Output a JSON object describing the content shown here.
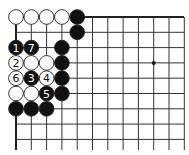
{
  "diagram": {
    "type": "go-board-fragment",
    "corner": "top-left",
    "grid": {
      "x0": 16,
      "y0": 17,
      "spacing": 15.3,
      "cols": 12,
      "rows": 9,
      "right_extent": 184,
      "bottom_extent": 150,
      "line_color": "#333333",
      "edge_color": "#222222"
    },
    "star_points": [
      {
        "col": 9,
        "row": 3
      }
    ],
    "stones": [
      {
        "col": 0,
        "row": 0,
        "color": "white",
        "label": ""
      },
      {
        "col": 1,
        "row": 0,
        "color": "white",
        "label": ""
      },
      {
        "col": 2,
        "row": 0,
        "color": "white",
        "label": ""
      },
      {
        "col": 3,
        "row": 0,
        "color": "white",
        "label": ""
      },
      {
        "col": 4,
        "row": 0,
        "color": "black",
        "label": ""
      },
      {
        "col": 4,
        "row": 1,
        "color": "black",
        "label": ""
      },
      {
        "col": 0,
        "row": 2,
        "color": "black",
        "label": "1"
      },
      {
        "col": 1,
        "row": 2,
        "color": "black",
        "label": "7"
      },
      {
        "col": 3,
        "row": 2,
        "color": "black",
        "label": ""
      },
      {
        "col": 0,
        "row": 3,
        "color": "white",
        "label": "2"
      },
      {
        "col": 1,
        "row": 3,
        "color": "white",
        "label": ""
      },
      {
        "col": 2,
        "row": 3,
        "color": "white",
        "label": ""
      },
      {
        "col": 3,
        "row": 3,
        "color": "black",
        "label": ""
      },
      {
        "col": 0,
        "row": 4,
        "color": "white",
        "label": "6"
      },
      {
        "col": 1,
        "row": 4,
        "color": "black",
        "label": "3"
      },
      {
        "col": 2,
        "row": 4,
        "color": "white",
        "label": "4"
      },
      {
        "col": 3,
        "row": 4,
        "color": "black",
        "label": ""
      },
      {
        "col": 0,
        "row": 5,
        "color": "white",
        "label": ""
      },
      {
        "col": 1,
        "row": 5,
        "color": "white",
        "label": ""
      },
      {
        "col": 2,
        "row": 5,
        "color": "black",
        "label": "5"
      },
      {
        "col": 3,
        "row": 5,
        "color": "black",
        "label": ""
      },
      {
        "col": 0,
        "row": 6,
        "color": "black",
        "label": ""
      },
      {
        "col": 1,
        "row": 6,
        "color": "black",
        "label": ""
      },
      {
        "col": 2,
        "row": 6,
        "color": "black",
        "label": ""
      }
    ],
    "colors": {
      "black_stone": "#111111",
      "white_stone": "#ffffff",
      "stone_outline": "#222222"
    }
  }
}
